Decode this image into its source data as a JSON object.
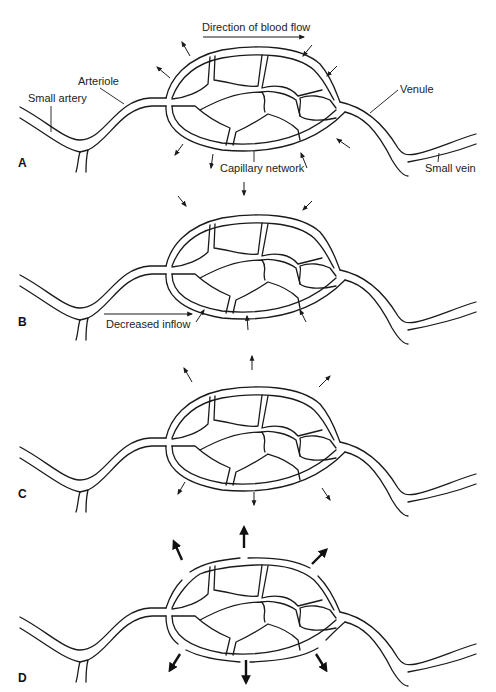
{
  "figure": {
    "type": "capillary bed diagram",
    "panels": [
      {
        "letter": "A",
        "labels": {
          "direction": "Direction of blood flow",
          "arteriole": "Arteriole",
          "small_artery": "Small artery",
          "venule": "Venule",
          "capillary": "Capillary network",
          "small_vein": "Small vein"
        },
        "arrows": "small arrows out on arterial side, in on venous side"
      },
      {
        "letter": "B",
        "labels": {
          "inflow": "Decreased inflow"
        },
        "arrows": "small arrows pointing inward all around"
      },
      {
        "letter": "C",
        "labels": {},
        "arrows": "small arrows pointing outward all around"
      },
      {
        "letter": "D",
        "labels": {},
        "arrows": "large bold arrows pointing outward through gaps in capillary wall"
      }
    ]
  }
}
